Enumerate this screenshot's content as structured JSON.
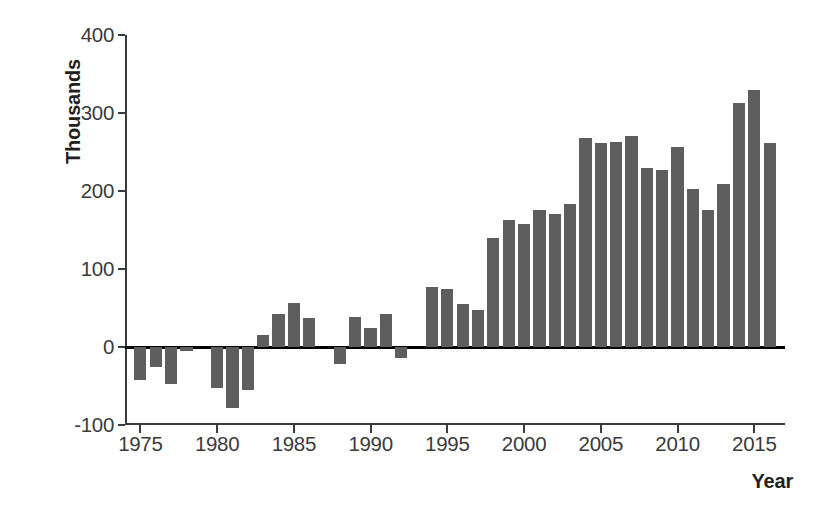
{
  "chart_data": {
    "type": "bar",
    "title": "",
    "subtitle": "",
    "xlabel": "Year",
    "ylabel": "Thousands",
    "ylim": [
      -100,
      400
    ],
    "ytick_values": [
      400,
      300,
      200,
      100,
      0,
      -100
    ],
    "ytick_labels": [
      "400",
      "300",
      "200",
      "100",
      "0",
      "-100"
    ],
    "xtick_values": [
      1975,
      1980,
      1985,
      1990,
      1995,
      2000,
      2005,
      2010,
      2015
    ],
    "xtick_labels": [
      "1975",
      "1980",
      "1985",
      "1990",
      "1995",
      "2000",
      "2005",
      "2010",
      "2015"
    ],
    "xlim": [
      1974,
      2017
    ],
    "grid": false,
    "legend": null,
    "bar_color": "#5e5e5e",
    "axis_color": "#3b3b3b",
    "zero_line_color": "#000000",
    "categories": [
      1975,
      1976,
      1977,
      1978,
      1979,
      1980,
      1981,
      1982,
      1983,
      1984,
      1985,
      1986,
      1987,
      1988,
      1989,
      1990,
      1991,
      1992,
      1993,
      1994,
      1995,
      1996,
      1997,
      1998,
      1999,
      2000,
      2001,
      2002,
      2003,
      2004,
      2005,
      2006,
      2007,
      2008,
      2009,
      2010,
      2011,
      2012,
      2013,
      2014,
      2015,
      2016
    ],
    "values": [
      -42,
      -25,
      -47,
      -5,
      0,
      -52,
      -78,
      -55,
      15,
      42,
      57,
      37,
      0,
      -22,
      38,
      25,
      42,
      -14,
      0,
      77,
      74,
      55,
      48,
      140,
      163,
      158,
      176,
      170,
      183,
      268,
      262,
      263,
      271,
      229,
      227,
      256,
      203,
      176,
      209,
      313,
      330,
      262
    ]
  }
}
